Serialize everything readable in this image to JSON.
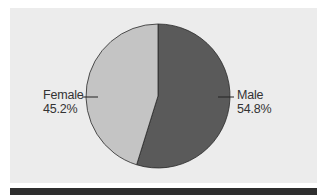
{
  "chart_data": {
    "type": "pie",
    "title": "",
    "categories": [
      "Male",
      "Female"
    ],
    "values": [
      54.8,
      45.2
    ],
    "unit": "%",
    "colors": [
      "#5a5a5a",
      "#c4c4c4"
    ],
    "labels": [
      {
        "name": "Male",
        "value_text": "54.8%"
      },
      {
        "name": "Female",
        "value_text": "45.2%"
      }
    ],
    "start_angle_deg": 0,
    "direction": "clockwise",
    "legend": "none (callout labels with leader lines)"
  },
  "panel": {
    "background": "#ececec",
    "bottom_bar_color": "#2e2e2e"
  }
}
